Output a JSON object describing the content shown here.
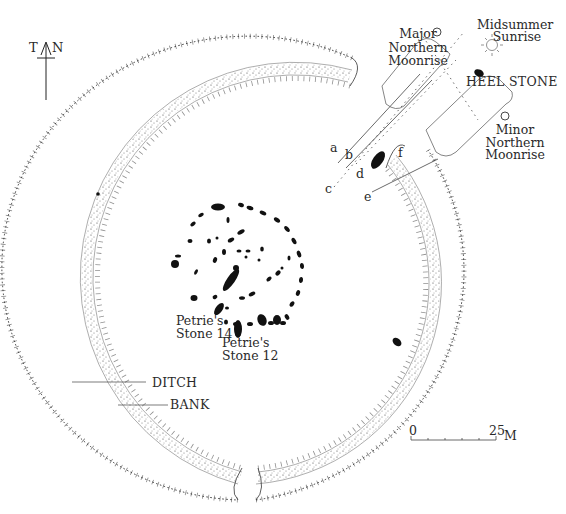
{
  "diagram": {
    "north_arrow": {
      "left_label": "T",
      "right_label": "N"
    },
    "labels": {
      "major_moonrise": [
        "Major",
        "Northern",
        "Moonrise"
      ],
      "midsummer_sunrise": [
        "Midsummer",
        "Sunrise"
      ],
      "heel_stone": "HEEL STONE",
      "minor_moonrise": [
        "Minor",
        "Northern",
        "Moonrise"
      ],
      "petrie_14": [
        "Petrie's",
        "Stone 14"
      ],
      "petrie_12": [
        "Petrie's",
        "Stone 12"
      ],
      "ditch": "DITCH",
      "bank": "BANK"
    },
    "sightline_letters": [
      "a",
      "b",
      "c",
      "d",
      "e",
      "f"
    ],
    "scale_bar": {
      "start": "0",
      "end": "25",
      "unit": "M",
      "ticks": 5
    },
    "colors": {
      "ink": "#1a1a1a",
      "stipple": "#555555",
      "background": "#ffffff"
    }
  }
}
